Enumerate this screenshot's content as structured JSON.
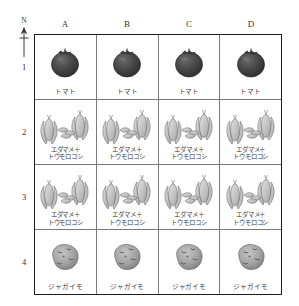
{
  "figure": {
    "compass": {
      "label": "N",
      "icon": "north-arrow-icon"
    },
    "columns": [
      "A",
      "B",
      "C",
      "D"
    ],
    "rows": [
      "1",
      "2",
      "3",
      "4"
    ],
    "crops": {
      "tomato": {
        "label": "トマト",
        "icon": "tomato-icon",
        "color": "#3f3f3f"
      },
      "edamame_corn": {
        "label": "エダマメ＋\nトウモロコシ",
        "icon": "edamame-corn-icon",
        "color": "#b9b9b9"
      },
      "potato": {
        "label": "ジャガイモ",
        "icon": "potato-icon",
        "color": "#9a9a9a"
      }
    },
    "plots": [
      [
        {
          "row": "1",
          "col": "A",
          "crop": "トマト"
        },
        {
          "row": "1",
          "col": "B",
          "crop": "トマト"
        },
        {
          "row": "1",
          "col": "C",
          "crop": "トマト"
        },
        {
          "row": "1",
          "col": "D",
          "crop": "トマト"
        }
      ],
      [
        {
          "row": "2",
          "col": "A",
          "crop": "エダマメ＋\nトウモロコシ"
        },
        {
          "row": "2",
          "col": "B",
          "crop": "エダマメ＋\nトウモロコシ"
        },
        {
          "row": "2",
          "col": "C",
          "crop": "エダマメ＋\nトウモロコシ"
        },
        {
          "row": "2",
          "col": "D",
          "crop": "エダマメ＋\nトウモロコシ"
        }
      ],
      [
        {
          "row": "3",
          "col": "A",
          "crop": "エダマメ＋\nトウモロコシ"
        },
        {
          "row": "3",
          "col": "B",
          "crop": "エダマメ＋\nトウモロコシ"
        },
        {
          "row": "3",
          "col": "C",
          "crop": "エダマメ＋\nトウモロコシ"
        },
        {
          "row": "3",
          "col": "D",
          "crop": "エダマメ＋\nトウモロコシ"
        }
      ],
      [
        {
          "row": "4",
          "col": "A",
          "crop": "ジャガイモ"
        },
        {
          "row": "4",
          "col": "B",
          "crop": "ジャガイモ"
        },
        {
          "row": "4",
          "col": "C",
          "crop": "ジャガイモ"
        },
        {
          "row": "4",
          "col": "D",
          "crop": "ジャガイモ"
        }
      ]
    ]
  }
}
